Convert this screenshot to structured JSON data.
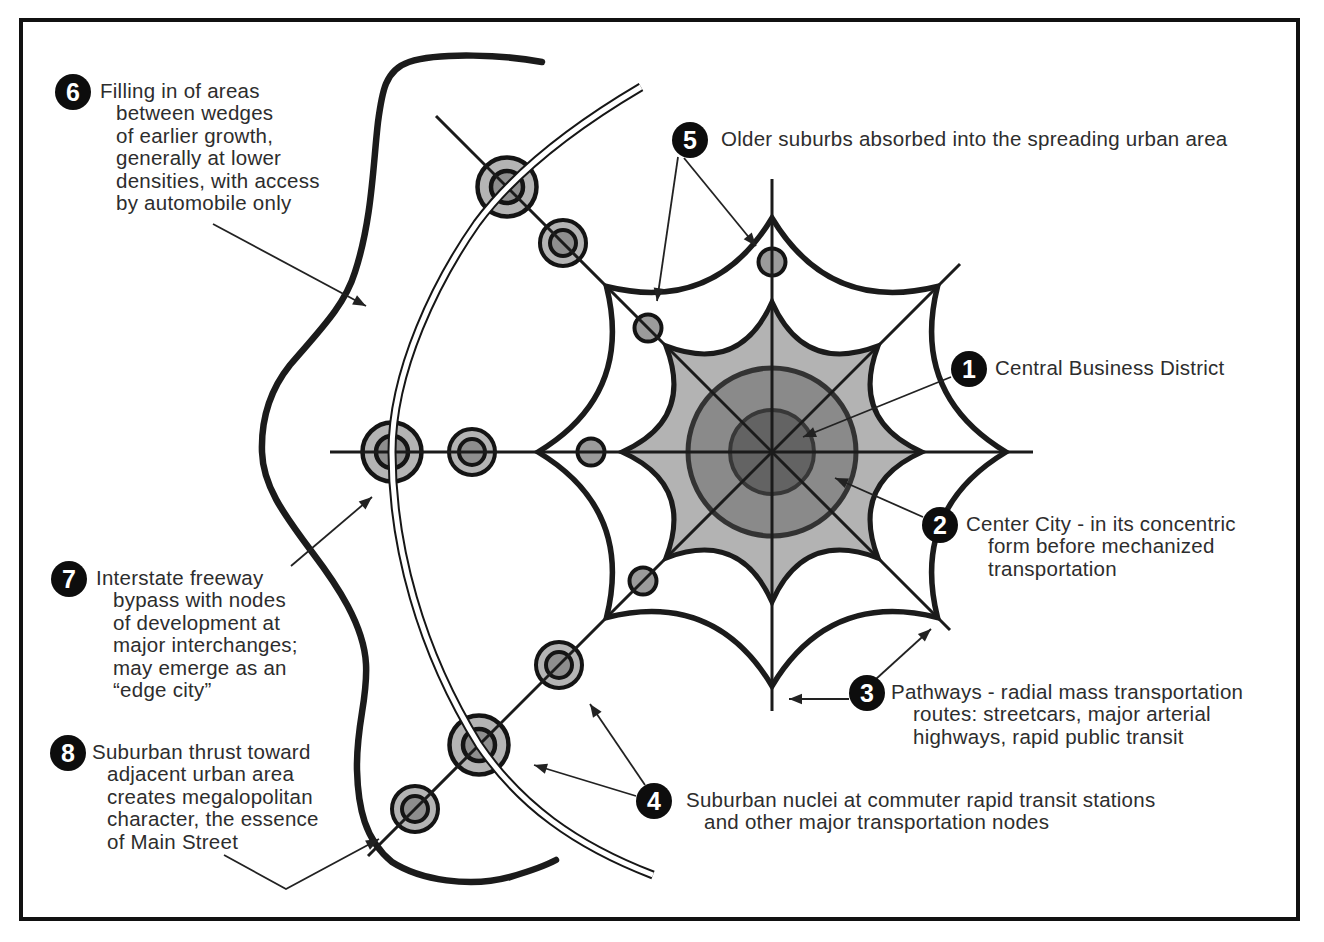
{
  "figure": {
    "type": "urban-growth-star-diagram",
    "annotations": [
      {
        "number": "1",
        "lines": [
          "Central Business District"
        ]
      },
      {
        "number": "2",
        "lines": [
          "Center City - in its concentric",
          "form before mechanized",
          "transportation"
        ]
      },
      {
        "number": "3",
        "lines": [
          "Pathways - radial mass transportation",
          "routes: streetcars, major arterial",
          "highways, rapid public transit"
        ]
      },
      {
        "number": "4",
        "lines": [
          "Suburban nuclei at commuter rapid transit stations",
          "and other major transportation nodes"
        ]
      },
      {
        "number": "5",
        "lines": [
          "Older suburbs absorbed into the spreading urban area"
        ]
      },
      {
        "number": "6",
        "lines": [
          "Filling in of areas",
          "between wedges",
          "of earlier growth,",
          "generally at lower",
          "densities, with access",
          "by automobile only"
        ]
      },
      {
        "number": "7",
        "lines": [
          "Interstate freeway",
          "bypass with nodes",
          "of development at",
          "major interchanges;",
          "may emerge as an",
          "“edge city”"
        ]
      },
      {
        "number": "8",
        "lines": [
          "Suburban thrust toward",
          "adjacent urban area",
          "creates megalopolitan",
          "character, the essence",
          "of Main Street"
        ]
      }
    ],
    "colors": {
      "background": "#ffffff",
      "outline": "#1b1b1b",
      "urban_area_fill": "#b3b3b3",
      "center_city_fill": "#8a8a8a",
      "cbd_fill": "#636363",
      "node_ring_fill": "#b4b4b4",
      "node_core_fill": "#8e8e8e",
      "suburb_node_fill": "#9b9b9b",
      "badge_fill": "#0d0d0d",
      "badge_text": "#ffffff",
      "text": "#2d2d2d",
      "arrow": "#222222"
    }
  }
}
